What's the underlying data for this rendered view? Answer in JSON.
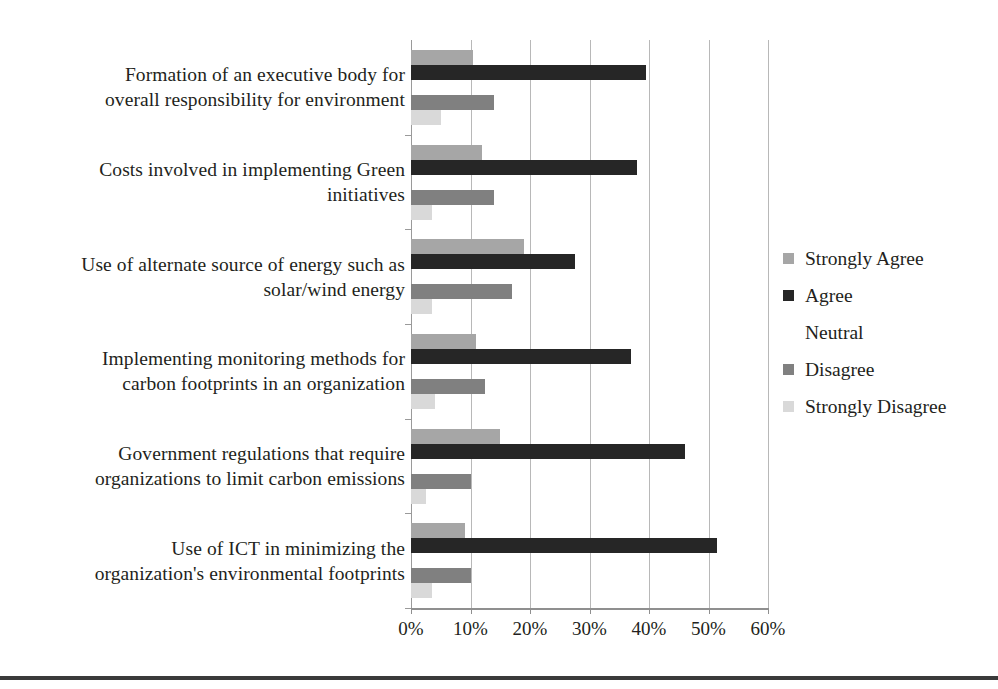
{
  "chart_data": {
    "type": "bar",
    "orientation": "horizontal",
    "title": "",
    "xlabel": "",
    "ylabel": "",
    "xlim": [
      0,
      60
    ],
    "grid": true,
    "legend_position": "right",
    "xticks": [
      "0%",
      "10%",
      "20%",
      "30%",
      "40%",
      "50%",
      "60%"
    ],
    "xtick_values": [
      0,
      10,
      20,
      30,
      40,
      50,
      60
    ],
    "categories": [
      "Formation of an executive body for overall responsibility for environment",
      "Costs involved in implementing Green initiatives",
      "Use of alternate source of energy such as solar/wind energy",
      "Implementing monitoring methods for carbon footprints in an organization",
      "Government regulations that require organizations to limit carbon emissions",
      "Use of ICT in minimizing the organization's environmental footprints"
    ],
    "category_lines": [
      [
        "Formation of an executive body for",
        "overall responsibility for environment"
      ],
      [
        "Costs involved in implementing Green",
        "initiatives"
      ],
      [
        "Use of alternate source of energy such as",
        "solar/wind energy"
      ],
      [
        "Implementing monitoring methods for",
        "carbon footprints in an organization"
      ],
      [
        "Government regulations that require",
        "organizations to limit carbon emissions"
      ],
      [
        "Use of ICT in minimizing the",
        "organization's environmental footprints"
      ]
    ],
    "series": [
      {
        "name": "Strongly Agree",
        "color": "#a6a6a6",
        "values": [
          10.5,
          12.0,
          19.0,
          11.0,
          15.0,
          9.0
        ]
      },
      {
        "name": "Agree",
        "color": "#262626",
        "values": [
          39.5,
          38.0,
          27.5,
          37.0,
          46.0,
          51.5
        ]
      },
      {
        "name": "Neutral",
        "color": "#ffffff",
        "values": [
          0.0,
          0.0,
          0.0,
          0.0,
          0.0,
          0.0
        ]
      },
      {
        "name": "Disagree",
        "color": "#808080",
        "values": [
          14.0,
          14.0,
          17.0,
          12.5,
          10.0,
          10.0
        ]
      },
      {
        "name": "Strongly Disagree",
        "color": "#d9d9d9",
        "values": [
          5.0,
          3.5,
          3.5,
          4.0,
          2.5,
          3.5
        ]
      }
    ]
  },
  "legend": {
    "items": [
      {
        "label": "Strongly Agree",
        "color": "#a6a6a6",
        "swatch_visible": true
      },
      {
        "label": "Agree",
        "color": "#262626",
        "swatch_visible": true
      },
      {
        "label": "Neutral",
        "color": "#ffffff",
        "swatch_visible": false
      },
      {
        "label": "Disagree",
        "color": "#808080",
        "swatch_visible": true
      },
      {
        "label": "Strongly Disagree",
        "color": "#d9d9d9",
        "swatch_visible": true
      }
    ]
  }
}
